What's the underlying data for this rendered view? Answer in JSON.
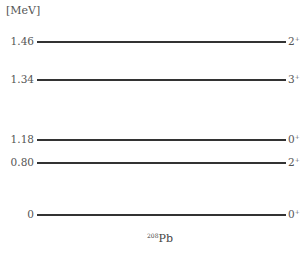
{
  "diagram": {
    "unit_label": "[MeV]",
    "nucleus": {
      "mass_number": "208",
      "symbol": "Pb"
    },
    "levels": [
      {
        "energy": "1.46",
        "spin": "2",
        "parity": "+"
      },
      {
        "energy": "1.34",
        "spin": "3",
        "parity": "+"
      },
      {
        "energy": "1.18",
        "spin": "0",
        "parity": "+"
      },
      {
        "energy": "0.80",
        "spin": "2",
        "parity": "+"
      },
      {
        "energy": "0",
        "spin": "0",
        "parity": "+"
      }
    ]
  }
}
